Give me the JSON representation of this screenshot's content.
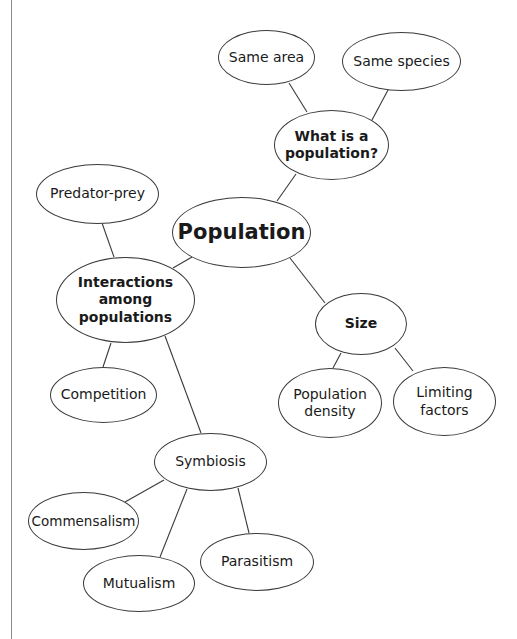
{
  "diagram": {
    "type": "concept-map",
    "root": "Population",
    "nodes": [
      {
        "id": "population",
        "label": "Population",
        "level": "root",
        "cx": 241,
        "cy": 232,
        "rx": 69,
        "ry": 35
      },
      {
        "id": "what-is",
        "label": "What is a population?",
        "level": "1",
        "cx": 331,
        "cy": 145,
        "rx": 57,
        "ry": 35
      },
      {
        "id": "same-area",
        "label": "Same area",
        "level": "2",
        "cx": 266,
        "cy": 57,
        "rx": 48,
        "ry": 27
      },
      {
        "id": "same-species",
        "label": "Same species",
        "level": "2",
        "cx": 401,
        "cy": 61,
        "rx": 59,
        "ry": 29
      },
      {
        "id": "interactions",
        "label": "Interactions among populations",
        "level": "1",
        "cx": 125,
        "cy": 300,
        "rx": 69,
        "ry": 43
      },
      {
        "id": "predator-prey",
        "label": "Predator-prey",
        "level": "2",
        "cx": 97,
        "cy": 194,
        "rx": 61,
        "ry": 30
      },
      {
        "id": "competition",
        "label": "Competition",
        "level": "2",
        "cx": 103,
        "cy": 395,
        "rx": 53,
        "ry": 28
      },
      {
        "id": "symbiosis",
        "label": "Symbiosis",
        "level": "2",
        "cx": 210,
        "cy": 462,
        "rx": 56,
        "ry": 29
      },
      {
        "id": "commensalism",
        "label": "Commensalism",
        "level": "2",
        "cx": 83,
        "cy": 521,
        "rx": 55,
        "ry": 29
      },
      {
        "id": "mutualism",
        "label": "Mutualism",
        "level": "2",
        "cx": 139,
        "cy": 583,
        "rx": 56,
        "ry": 28
      },
      {
        "id": "parasitism",
        "label": "Parasitism",
        "level": "2",
        "cx": 257,
        "cy": 562,
        "rx": 57,
        "ry": 29
      },
      {
        "id": "size",
        "label": "Size",
        "level": "1",
        "cx": 361,
        "cy": 324,
        "rx": 46,
        "ry": 31
      },
      {
        "id": "population-density",
        "label": "Population density",
        "level": "2",
        "cx": 330,
        "cy": 403,
        "rx": 52,
        "ry": 35
      },
      {
        "id": "limiting-factors",
        "label": "Limiting factors",
        "level": "2",
        "cx": 444,
        "cy": 401,
        "rx": 51,
        "ry": 34
      }
    ],
    "edges": [
      {
        "from": "what-is",
        "to": "same-area",
        "x1": 307,
        "y1": 112,
        "x2": 289,
        "y2": 83
      },
      {
        "from": "what-is",
        "to": "same-species",
        "x1": 372,
        "y1": 120,
        "x2": 388,
        "y2": 90
      },
      {
        "from": "population",
        "to": "what-is",
        "x1": 277,
        "y1": 201,
        "x2": 296,
        "y2": 174
      },
      {
        "from": "interactions",
        "to": "predator-prey",
        "x1": 114,
        "y1": 257,
        "x2": 102,
        "y2": 223
      },
      {
        "from": "population",
        "to": "interactions",
        "x1": 192,
        "y1": 257,
        "x2": 173,
        "y2": 268
      },
      {
        "from": "population",
        "to": "size",
        "x1": 290,
        "y1": 258,
        "x2": 325,
        "y2": 303
      },
      {
        "from": "interactions",
        "to": "competition",
        "x1": 111,
        "y1": 343,
        "x2": 103,
        "y2": 367
      },
      {
        "from": "interactions",
        "to": "symbiosis",
        "x1": 165,
        "y1": 336,
        "x2": 201,
        "y2": 433
      },
      {
        "from": "size",
        "to": "population-density",
        "x1": 341,
        "y1": 353,
        "x2": 333,
        "y2": 368
      },
      {
        "from": "size",
        "to": "limiting-factors",
        "x1": 395,
        "y1": 348,
        "x2": 413,
        "y2": 371
      },
      {
        "from": "symbiosis",
        "to": "commensalism",
        "x1": 164,
        "y1": 480,
        "x2": 125,
        "y2": 502
      },
      {
        "from": "symbiosis",
        "to": "mutualism",
        "x1": 187,
        "y1": 489,
        "x2": 160,
        "y2": 557
      },
      {
        "from": "symbiosis",
        "to": "parasitism",
        "x1": 238,
        "y1": 488,
        "x2": 249,
        "y2": 533
      }
    ]
  },
  "labels": {
    "population": "Population",
    "what_is_line1": "What is a",
    "what_is_line2": "population?",
    "same_area": "Same area",
    "same_species": "Same species",
    "interactions_line1": "Interactions",
    "interactions_line2": "among",
    "interactions_line3": "populations",
    "predator_prey": "Predator-prey",
    "competition": "Competition",
    "symbiosis": "Symbiosis",
    "commensalism": "Commensalism",
    "mutualism": "Mutualism",
    "parasitism": "Parasitism",
    "size": "Size",
    "population_density_line1": "Population",
    "population_density_line2": "density",
    "limiting_factors_line1": "Limiting",
    "limiting_factors_line2": "factors"
  },
  "colors": {
    "stroke": "#3a3a3a",
    "text": "#1a1a1a",
    "background": "#ffffff",
    "page_border": "#8a8a8a"
  }
}
